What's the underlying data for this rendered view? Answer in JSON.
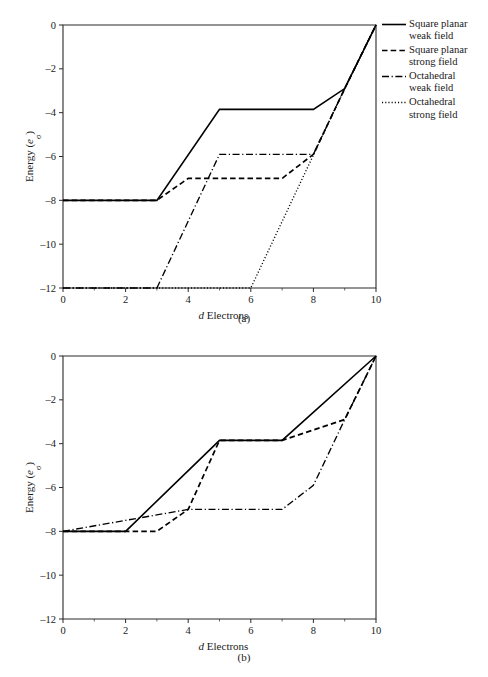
{
  "chart_data": [
    {
      "panel": "(a)",
      "type": "line",
      "title": "",
      "xlabel": "d Electrons",
      "xlabel_italic_prefix": "d",
      "xlabel_rest": " Electrons",
      "ylabel": "Energy (eσ)",
      "ylabel_main": "Energy (",
      "ylabel_italic": "e",
      "ylabel_sub": "σ",
      "ylabel_close": ")",
      "xlim": [
        0,
        10
      ],
      "ylim": [
        -12,
        0
      ],
      "xticks": [
        0,
        2,
        4,
        6,
        8,
        10
      ],
      "xtick_labels": [
        "0",
        "2",
        "4",
        "6",
        "8",
        "10"
      ],
      "yticks": [
        0,
        -2,
        -4,
        -6,
        -8,
        -10,
        -12
      ],
      "ytick_labels": [
        "0",
        "–2",
        "–4",
        "–6",
        "–8",
        "–10",
        "–12"
      ],
      "grid": false,
      "legend_position": "right",
      "series": [
        {
          "name": "Square planar weak field",
          "style": "solid",
          "x": [
            0,
            3,
            5,
            8,
            9,
            10
          ],
          "y": [
            -8,
            -8,
            -3.85,
            -3.85,
            -2.9,
            0
          ]
        },
        {
          "name": "Square planar strong field",
          "style": "dashed",
          "x": [
            0,
            3,
            4,
            7,
            8,
            9,
            10
          ],
          "y": [
            -8,
            -8,
            -7,
            -7,
            -5.9,
            -2.9,
            0
          ]
        },
        {
          "name": "Octahedral weak field",
          "style": "dashdot",
          "x": [
            0,
            3,
            5,
            8,
            9,
            10
          ],
          "y": [
            -12,
            -12,
            -5.9,
            -5.9,
            -2.9,
            0
          ]
        },
        {
          "name": "Octahedral strong field",
          "style": "dotted",
          "x": [
            0,
            6,
            9,
            10
          ],
          "y": [
            -12,
            -12,
            -2.9,
            0
          ]
        }
      ]
    },
    {
      "panel": "(b)",
      "type": "line",
      "title": "",
      "xlabel": "d Electrons",
      "xlabel_italic_prefix": "d",
      "xlabel_rest": " Electrons",
      "ylabel": "Energy (eσ)",
      "ylabel_main": "Energy (",
      "ylabel_italic": "e",
      "ylabel_sub": "σ",
      "ylabel_close": ")",
      "xlim": [
        0,
        10
      ],
      "ylim": [
        -12,
        0
      ],
      "xticks": [
        0,
        2,
        4,
        6,
        8,
        10
      ],
      "xtick_labels": [
        "0",
        "2",
        "4",
        "6",
        "8",
        "10"
      ],
      "yticks": [
        0,
        -2,
        -4,
        -6,
        -8,
        -10,
        -12
      ],
      "ytick_labels": [
        "0",
        "–2",
        "–4",
        "–6",
        "–8",
        "–10",
        "–12"
      ],
      "grid": false,
      "legend_position": "right",
      "series": [
        {
          "name": "Tetrahedral",
          "style": "solid",
          "x": [
            0,
            2,
            5,
            7,
            10
          ],
          "y": [
            -8,
            -8,
            -3.85,
            -3.85,
            0
          ]
        },
        {
          "name": "Square planar weak field",
          "style": "dashed",
          "x": [
            0,
            3,
            4,
            5,
            7,
            9,
            10
          ],
          "y": [
            -8,
            -8,
            -7,
            -3.85,
            -3.85,
            -2.9,
            0
          ]
        },
        {
          "name": "Square planar strong field",
          "style": "dashdot",
          "x": [
            0,
            4,
            7,
            8,
            9,
            10
          ],
          "y": [
            -8,
            -7,
            -7,
            -5.9,
            -2.9,
            0
          ]
        }
      ]
    }
  ],
  "figure_a": {
    "panel_label": "(a)",
    "xlabel_italic": "d",
    "xlabel_rest": " Electrons",
    "ylabel_prefix": "Energy (",
    "ylabel_italic": "e",
    "ylabel_sub": "σ",
    "ylabel_suffix": ")",
    "legend": [
      {
        "style": "solid",
        "line1": "Square planar",
        "line2": "weak field"
      },
      {
        "style": "dashed",
        "line1": "Square planar",
        "line2": "strong field"
      },
      {
        "style": "dashdot",
        "line1": "Octahedral",
        "line2": "weak field"
      },
      {
        "style": "dotted",
        "line1": "Octahedral",
        "line2": "strong field"
      }
    ]
  },
  "figure_b": {
    "panel_label": "(b)",
    "xlabel_italic": "d",
    "xlabel_rest": " Electrons",
    "ylabel_prefix": "Energy (",
    "ylabel_italic": "e",
    "ylabel_sub": "σ",
    "ylabel_suffix": ")",
    "legend": [
      {
        "style": "solid",
        "line1": "Tetrahedral",
        "line2": ""
      },
      {
        "style": "dashed",
        "line1": "Square planar",
        "line2": "weak field"
      },
      {
        "style": "dashdot",
        "line1": "Square planar",
        "line2": "strong field"
      }
    ]
  },
  "colors": {
    "line": "#000000",
    "axis": "#2b2b2b",
    "text": "#1a1a1a",
    "background": "#ffffff"
  }
}
